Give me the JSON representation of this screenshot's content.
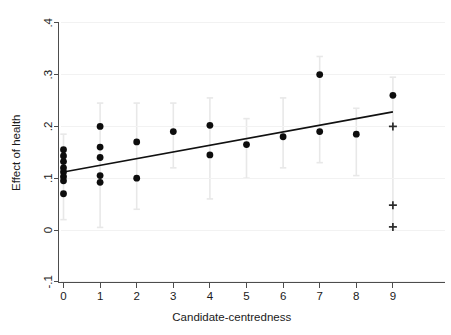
{
  "chart_data": {
    "type": "scatter",
    "title": "",
    "subtitle": "",
    "xlabel": "Candidate-centredness",
    "ylabel": "Effect of health",
    "xlim": [
      -0.45,
      9.8
    ],
    "ylim": [
      -0.12,
      0.42
    ],
    "xticks": [
      0,
      1,
      2,
      3,
      4,
      5,
      6,
      7,
      8,
      9
    ],
    "xticklabels": [
      "0",
      "1",
      "2",
      "3",
      "4",
      "5",
      "6",
      "7",
      "8",
      "9"
    ],
    "yticks": [
      -0.1,
      0,
      0.1,
      0.2,
      0.3,
      0.4
    ],
    "yticklabels": [
      "-.1",
      "0",
      ".1",
      ".2",
      ".3",
      ".4"
    ],
    "grid": false,
    "legend": null,
    "series": [
      {
        "name": "Effect estimate (filled circle)",
        "marker": "circle",
        "color": "#0d0d0d",
        "points": [
          {
            "x": 0,
            "y": 0.155,
            "ci_low": 0.02,
            "ci_high": 0.185
          },
          {
            "x": 0,
            "y": 0.143,
            "ci_low": 0.02,
            "ci_high": 0.185
          },
          {
            "x": 0,
            "y": 0.132,
            "ci_low": 0.02,
            "ci_high": 0.185
          },
          {
            "x": 0,
            "y": 0.12,
            "ci_low": 0.02,
            "ci_high": 0.185
          },
          {
            "x": 0,
            "y": 0.112,
            "ci_low": 0.02,
            "ci_high": 0.185
          },
          {
            "x": 0,
            "y": 0.103,
            "ci_low": 0.02,
            "ci_high": 0.185
          },
          {
            "x": 0,
            "y": 0.095,
            "ci_low": 0.02,
            "ci_high": 0.185
          },
          {
            "x": 0,
            "y": 0.07,
            "ci_low": 0.02,
            "ci_high": 0.185
          },
          {
            "x": 1,
            "y": 0.2,
            "ci_low": 0.005,
            "ci_high": 0.245
          },
          {
            "x": 1,
            "y": 0.16,
            "ci_low": 0.005,
            "ci_high": 0.245
          },
          {
            "x": 1,
            "y": 0.14,
            "ci_low": 0.005,
            "ci_high": 0.245
          },
          {
            "x": 1,
            "y": 0.105,
            "ci_low": 0.005,
            "ci_high": 0.245
          },
          {
            "x": 1,
            "y": 0.092,
            "ci_low": 0.005,
            "ci_high": 0.245
          },
          {
            "x": 2,
            "y": 0.17,
            "ci_low": 0.04,
            "ci_high": 0.245
          },
          {
            "x": 2,
            "y": 0.1,
            "ci_low": 0.04,
            "ci_high": 0.245
          },
          {
            "x": 3,
            "y": 0.19,
            "ci_low": 0.12,
            "ci_high": 0.245
          },
          {
            "x": 4,
            "y": 0.202,
            "ci_low": 0.06,
            "ci_high": 0.255
          },
          {
            "x": 4,
            "y": 0.145,
            "ci_low": 0.06,
            "ci_high": 0.255
          },
          {
            "x": 5,
            "y": 0.165,
            "ci_low": 0.1,
            "ci_high": 0.215
          },
          {
            "x": 6,
            "y": 0.18,
            "ci_low": 0.12,
            "ci_high": 0.255
          },
          {
            "x": 7,
            "y": 0.3,
            "ci_low": 0.13,
            "ci_high": 0.335
          },
          {
            "x": 7,
            "y": 0.19,
            "ci_low": 0.13,
            "ci_high": 0.335
          },
          {
            "x": 8,
            "y": 0.185,
            "ci_low": 0.105,
            "ci_high": 0.235
          },
          {
            "x": 9,
            "y": 0.26,
            "ci_low": 0.0,
            "ci_high": 0.295
          }
        ]
      },
      {
        "name": "Effect estimate (plus marker)",
        "marker": "plus",
        "color": "#2b2b2b",
        "points": [
          {
            "x": 9,
            "y": 0.2,
            "ci_low": 0.0,
            "ci_high": 0.295
          },
          {
            "x": 9,
            "y": 0.048,
            "ci_low": 0.0,
            "ci_high": 0.295
          },
          {
            "x": 9,
            "y": 0.006,
            "ci_low": 0.0,
            "ci_high": 0.295
          }
        ]
      }
    ],
    "fit_line": {
      "name": "linear fit",
      "x_start": 0,
      "y_start": 0.112,
      "x_end": 9,
      "y_end": 0.228,
      "slope": 0.0129,
      "intercept": 0.112
    }
  }
}
